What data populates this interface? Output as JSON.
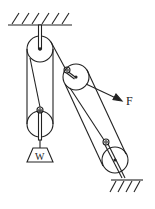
{
  "diagram": {
    "type": "pulley-system",
    "labels": {
      "force": "F",
      "weight": "W"
    },
    "colors": {
      "line": "#222222",
      "background": "#ffffff"
    },
    "components": [
      {
        "name": "ceiling-support",
        "kind": "fixed-surface"
      },
      {
        "name": "fixed-pulley-top",
        "kind": "pulley"
      },
      {
        "name": "movable-pulley-left",
        "kind": "pulley"
      },
      {
        "name": "movable-pulley-right-upper",
        "kind": "pulley"
      },
      {
        "name": "fixed-pulley-right-lower",
        "kind": "pulley"
      },
      {
        "name": "ground-support",
        "kind": "fixed-surface"
      },
      {
        "name": "weight",
        "kind": "load",
        "label": "W"
      },
      {
        "name": "pull-force",
        "kind": "force-arrow",
        "label": "F"
      }
    ]
  }
}
